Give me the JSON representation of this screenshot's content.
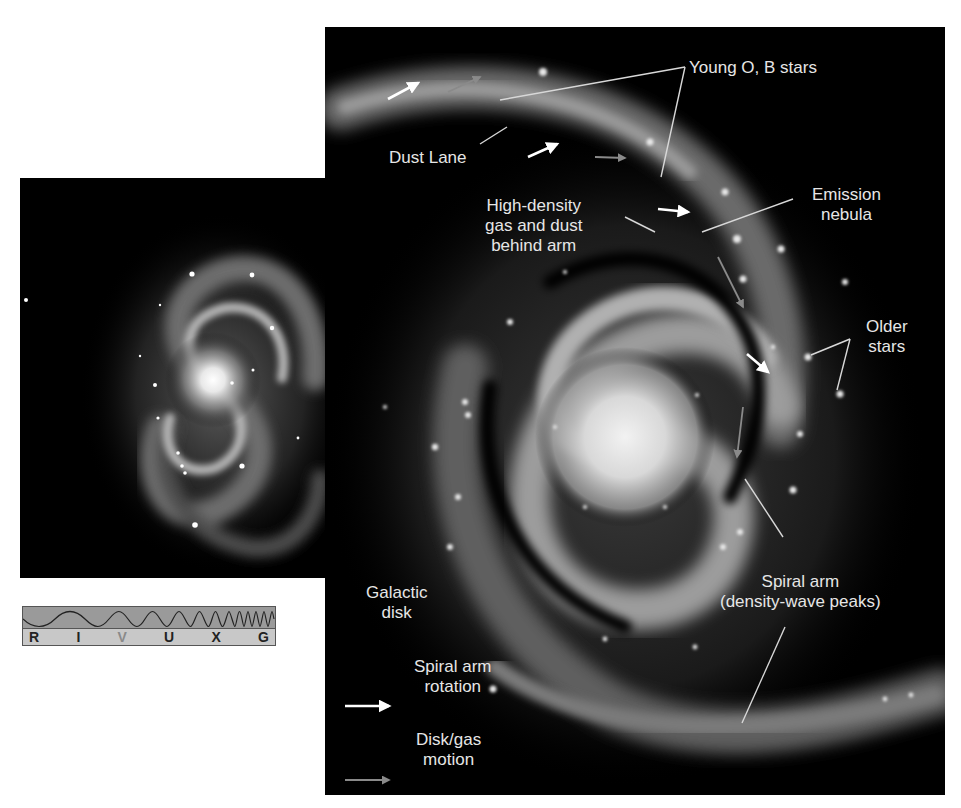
{
  "figure": {
    "photo_panel": {
      "description": "spiral galaxy photograph"
    },
    "spectrum_strip": {
      "bands": [
        "R",
        "I",
        "V",
        "U",
        "X",
        "G"
      ],
      "highlighted_band": "V"
    },
    "diagram_panel": {
      "labels": {
        "young_stars": "Young O, B stars",
        "dust_lane": "Dust Lane",
        "high_density": [
          "High-density",
          "gas and dust",
          "behind arm"
        ],
        "emission_nebula": [
          "Emission",
          "nebula"
        ],
        "older_stars": [
          "Older",
          "stars"
        ],
        "galactic_disk": [
          "Galactic",
          "disk"
        ],
        "spiral_arm": [
          "Spiral arm",
          "(density-wave peaks)"
        ]
      },
      "legend": {
        "rotation": [
          "Spiral arm",
          "rotation"
        ],
        "disk_motion": [
          "Disk/gas",
          "motion"
        ],
        "rotation_color": "#ffffff",
        "disk_motion_color": "#8a8a8a"
      }
    }
  }
}
